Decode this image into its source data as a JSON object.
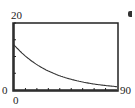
{
  "chart_data": {
    "type": "line",
    "title": "",
    "xlabel": "",
    "ylabel": "",
    "xlim": [
      0,
      90
    ],
    "ylim": [
      0,
      20
    ],
    "x_tick_step": 10,
    "y_tick_step": 5,
    "grid": false,
    "series": [
      {
        "name": "decay",
        "x": [
          0,
          10,
          20,
          30,
          40,
          50,
          60,
          70,
          80,
          90
        ],
        "values": [
          13.5,
          10.0,
          7.5,
          5.6,
          4.2,
          3.1,
          2.4,
          1.8,
          1.3,
          1.0
        ]
      }
    ],
    "labels": {
      "ymax": "20",
      "ymin": "0",
      "xmin": "0",
      "xmax": "90"
    },
    "color": "#333333"
  }
}
